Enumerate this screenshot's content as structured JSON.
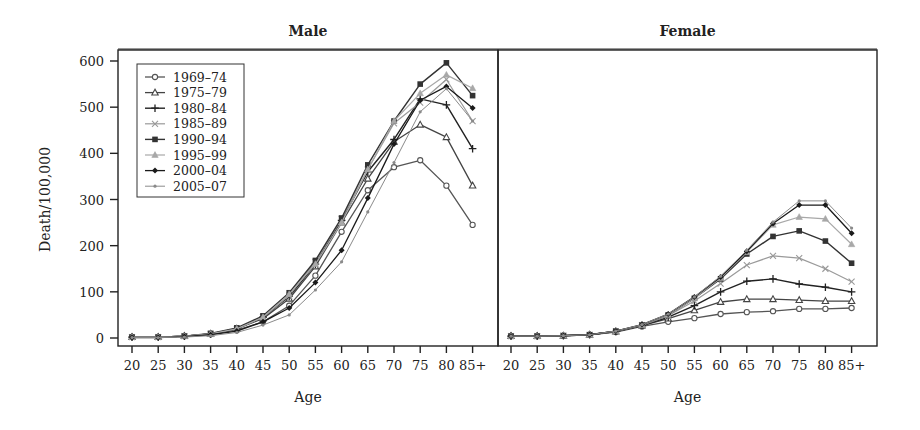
{
  "chart_data": {
    "type": "line",
    "title": "",
    "ylabel": "Death/100,000",
    "xlabel": "Age",
    "ylim": [
      0,
      600
    ],
    "yticks": [
      0,
      100,
      200,
      300,
      400,
      500,
      600
    ],
    "categories": [
      "20",
      "25",
      "30",
      "35",
      "40",
      "45",
      "50",
      "55",
      "60",
      "65",
      "70",
      "75",
      "80",
      "85+"
    ],
    "legend_position": "upper-left (inside Male panel)",
    "grid": false,
    "legend": [
      "1969–74",
      "1975–79",
      "1980–84",
      "1985–89",
      "1990–94",
      "1995–99",
      "2000–04",
      "2005–07"
    ],
    "panels": [
      {
        "title": "Male",
        "series": [
          {
            "name": "1969–74",
            "values": [
              2,
              2,
              4,
              8,
              17,
              35,
              70,
              135,
              230,
              320,
              370,
              385,
              330,
              245
            ]
          },
          {
            "name": "1975–79",
            "values": [
              2,
              2,
              4,
              9,
              20,
              42,
              85,
              155,
              250,
              345,
              425,
              462,
              435,
              330
            ]
          },
          {
            "name": "1980–84",
            "values": [
              2,
              2,
              4,
              9,
              20,
              45,
              90,
              160,
              255,
              360,
              430,
              518,
              505,
              410
            ]
          },
          {
            "name": "1985–89",
            "values": [
              2,
              2,
              4,
              9,
              20,
              45,
              92,
              165,
              258,
              365,
              465,
              510,
              560,
              470
            ]
          },
          {
            "name": "1990–94",
            "values": [
              2,
              2,
              4,
              10,
              22,
              48,
              98,
              168,
              260,
              375,
              470,
              550,
              596,
              525
            ]
          },
          {
            "name": "1995–99",
            "values": [
              2,
              2,
              4,
              9,
              20,
              45,
              95,
              160,
              250,
              365,
              470,
              530,
              570,
              541
            ]
          },
          {
            "name": "2000–04",
            "values": [
              1,
              1,
              3,
              7,
              15,
              35,
              65,
              120,
              190,
              303,
              420,
              515,
              545,
              498
            ]
          },
          {
            "name": "2005–07",
            "values": [
              1,
              1,
              2,
              5,
              12,
              28,
              50,
              104,
              165,
              273,
              380,
              490,
              540,
              470
            ]
          }
        ]
      },
      {
        "title": "Female",
        "series": [
          {
            "name": "1969–74",
            "values": [
              4,
              4,
              5,
              7,
              13,
              25,
              35,
              43,
              52,
              56,
              58,
              63,
              63,
              65
            ]
          },
          {
            "name": "1975–79",
            "values": [
              4,
              4,
              5,
              7,
              14,
              27,
              42,
              60,
              78,
              84,
              84,
              82,
              80,
              80
            ]
          },
          {
            "name": "1980–84",
            "values": [
              4,
              4,
              5,
              7,
              14,
              27,
              45,
              70,
              100,
              123,
              128,
              117,
              110,
              100
            ]
          },
          {
            "name": "1985–89",
            "values": [
              4,
              4,
              5,
              7,
              14,
              28,
              48,
              80,
              118,
              158,
              178,
              173,
              150,
              122
            ]
          },
          {
            "name": "1990–94",
            "values": [
              4,
              4,
              5,
              7,
              15,
              28,
              50,
              86,
              128,
              182,
              220,
              232,
              210,
              162
            ]
          },
          {
            "name": "1995–99",
            "values": [
              4,
              4,
              5,
              7,
              15,
              28,
              50,
              86,
              130,
              186,
              245,
              262,
              258,
              203
            ]
          },
          {
            "name": "2000–04",
            "values": [
              4,
              4,
              5,
              7,
              15,
              29,
              52,
              89,
              132,
              188,
              248,
              288,
              288,
              227
            ]
          },
          {
            "name": "2005–07",
            "values": [
              4,
              4,
              5,
              7,
              15,
              29,
              52,
              89,
              134,
              190,
              251,
              297,
              297,
              238
            ]
          }
        ]
      }
    ]
  },
  "styles": {
    "series": [
      {
        "color": "#555555",
        "marker": "circle-open",
        "width": 1.3
      },
      {
        "color": "#444444",
        "marker": "triangle-open",
        "width": 1.3
      },
      {
        "color": "#222222",
        "marker": "plus",
        "width": 1.4
      },
      {
        "color": "#9a9a9a",
        "marker": "x",
        "width": 1.2
      },
      {
        "color": "#333333",
        "marker": "square-filled",
        "width": 1.4
      },
      {
        "color": "#a8a8a8",
        "marker": "triangle-filled",
        "width": 1.2
      },
      {
        "color": "#1a1a1a",
        "marker": "diamond-filled",
        "width": 1.3
      },
      {
        "color": "#8a8a8a",
        "marker": "dot",
        "width": 1.0
      }
    ]
  }
}
